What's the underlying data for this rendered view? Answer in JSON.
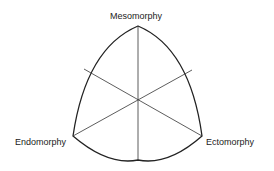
{
  "diagram": {
    "labels": {
      "top": "Mesomorphy",
      "left": "Endomorphy",
      "right": "Ectomorphy"
    },
    "stroke_color": "#222222"
  }
}
